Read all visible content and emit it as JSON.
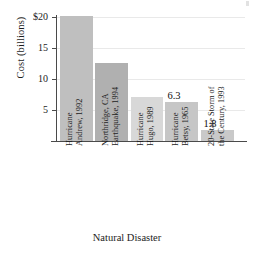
{
  "chart_data": {
    "type": "bar",
    "title": "",
    "xlabel": "Natural Disaster",
    "ylabel": "Cost (billions)",
    "categories": [
      "Hurricane Andrew, 1992",
      "Northridge, CA Earthquake, 1994",
      "Hurricane Hugo, 1989",
      "Hurricane Betsy, 1965",
      "20-State Storm of the Century, 1993"
    ],
    "values": [
      20.0,
      12.5,
      7.0,
      6.3,
      1.8
    ],
    "ylim": [
      0,
      20
    ],
    "yticks": [
      5,
      10,
      15,
      20
    ],
    "ytick_labels": [
      "5",
      "10",
      "15",
      "$20"
    ],
    "grid": true,
    "legend": "none",
    "value_labels": [
      "",
      "",
      "",
      "6.3",
      "1.8"
    ],
    "bar_colors": [
      "#bfbfbf",
      "#b0b0b0",
      "#d8d8d8",
      "#c6c6c6",
      "#c9c9c9"
    ]
  },
  "axes": {
    "y_title": "Cost (billions)",
    "x_title": "Natural Disaster",
    "y_ticks": [
      {
        "label": "$20",
        "value": 20
      },
      {
        "label": "15",
        "value": 15
      },
      {
        "label": "10",
        "value": 10
      },
      {
        "label": "5",
        "value": 5
      }
    ]
  },
  "bars": [
    {
      "category_line1": "Hurricane",
      "category_line2": "Andrew, 1992",
      "value": 20.0,
      "value_label": "",
      "color": "#bfbfbf"
    },
    {
      "category_line1": "Northridge, CA",
      "category_line2": "Earthquake, 1994",
      "value": 12.5,
      "value_label": "",
      "color": "#b0b0b0"
    },
    {
      "category_line1": "Hurricane",
      "category_line2": "Hugo, 1989",
      "value": 7.0,
      "value_label": "",
      "color": "#d8d8d8"
    },
    {
      "category_line1": "Hurricane",
      "category_line2": "Betsy, 1965",
      "value": 6.3,
      "value_label": "6.3",
      "color": "#c6c6c6"
    },
    {
      "category_line1": "20-State Storm of",
      "category_line2": "the Century, 1993",
      "value": 1.8,
      "value_label": "1.8",
      "color": "#c9c9c9"
    }
  ]
}
